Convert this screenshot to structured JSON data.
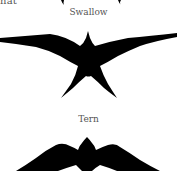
{
  "fragment_text": "nat",
  "birds": [
    {
      "name": "Swallow",
      "silhouette": "swallow-silhouette",
      "color": "#000000"
    },
    {
      "name": "Tern",
      "silhouette": "tern-silhouette",
      "color": "#000000"
    }
  ],
  "colors": {
    "background": "#ffffff",
    "silhouette": "#000000",
    "label_text": "#555555"
  }
}
